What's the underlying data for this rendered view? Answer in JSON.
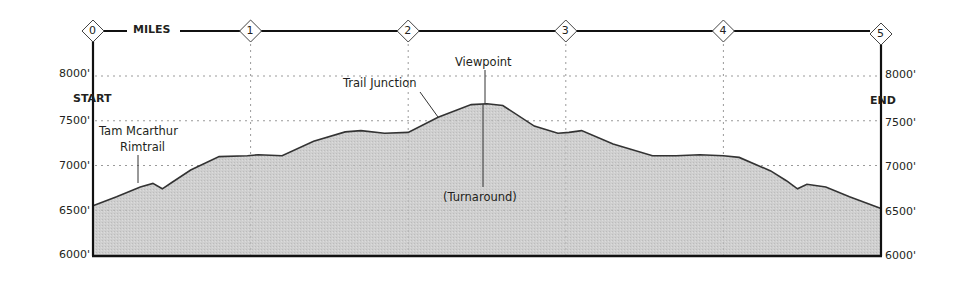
{
  "chart_data": {
    "type": "area",
    "title": "",
    "xlabel": "MILES",
    "ylabel": "",
    "x_ticks": [
      "0",
      "1",
      "2",
      "3",
      "4",
      "5"
    ],
    "y_ticks": [
      "6000'",
      "6500'",
      "7000'",
      "7500'",
      "8000'"
    ],
    "xlim": [
      0,
      5
    ],
    "ylim": [
      6000,
      8000
    ],
    "grid": true,
    "start_label": "START",
    "end_label": "END",
    "x": [
      0,
      0.15,
      0.3,
      0.38,
      0.44,
      0.5,
      0.62,
      0.8,
      0.98,
      1.05,
      1.2,
      1.4,
      1.6,
      1.7,
      1.85,
      2.0,
      2.19,
      2.4,
      2.5,
      2.6,
      2.8,
      2.95,
      3.02,
      3.1,
      3.3,
      3.55,
      3.7,
      3.85,
      4.0,
      4.1,
      4.3,
      4.4,
      4.47,
      4.53,
      4.65,
      4.8,
      5.0
    ],
    "values": [
      6550,
      6650,
      6760,
      6800,
      6740,
      6810,
      6950,
      7100,
      7110,
      7120,
      7110,
      7270,
      7375,
      7390,
      7360,
      7370,
      7540,
      7680,
      7690,
      7670,
      7440,
      7360,
      7370,
      7390,
      7240,
      7110,
      7110,
      7120,
      7110,
      7090,
      6940,
      6830,
      6740,
      6790,
      6760,
      6650,
      6520
    ],
    "annotations": [
      {
        "text": "Tam Mcarthur",
        "line2": "Rimtrail",
        "x": 0.3
      },
      {
        "text": "Trail Junction",
        "x": 2.19
      },
      {
        "text": "Viewpoint",
        "x": 2.45
      },
      {
        "text": "(Turnaround)",
        "x": 2.45
      }
    ]
  },
  "labels": {
    "miles": "MILES",
    "start": "START",
    "end": "END",
    "mile_markers": [
      "0",
      "1",
      "2",
      "3",
      "4",
      "5"
    ],
    "y_left": [
      "8000'",
      "7500'",
      "7000'",
      "6500'",
      "6000'"
    ],
    "y_right": [
      "8000'",
      "7500'",
      "7000'",
      "6500'",
      "6000'"
    ],
    "tam_line1": "Tam Mcarthur",
    "tam_line2": "Rimtrail",
    "trail_junction": "Trail Junction",
    "viewpoint": "Viewpoint",
    "turnaround": "(Turnaround)"
  },
  "colors": {
    "fill": "#cfcfcf",
    "line": "#333333",
    "axis": "#111111",
    "grid": "#9a9a9a"
  }
}
